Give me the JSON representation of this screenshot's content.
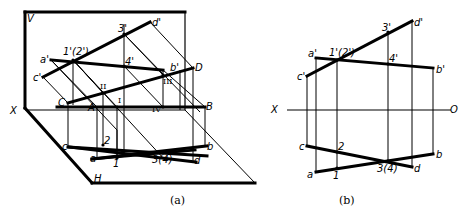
{
  "figure_a": {
    "caption": "(a)",
    "plane_labels": {
      "V": "V",
      "X": "X",
      "H": "H"
    },
    "points_vertical": {
      "a_prime": "a'",
      "c_prime": "c'",
      "p12_prime": "1'(2')",
      "p3_prime": "3'",
      "p4_prime": "4'",
      "d_prime": "d'",
      "b_prime": "b'"
    },
    "points_space": {
      "A": "A",
      "B": "B",
      "C": "C",
      "D": "D",
      "I": "I",
      "II": "II",
      "III": "III",
      "IV": "IV"
    },
    "points_horizontal": {
      "a": "a",
      "b": "b",
      "c": "c",
      "d": "d",
      "p1": "1",
      "p2": "2",
      "p34": "3(4)"
    }
  },
  "figure_b": {
    "caption": "(b)",
    "axis": {
      "left": "X",
      "right": "O"
    },
    "points_vertical": {
      "a_prime": "a'",
      "c_prime": "c'",
      "p12_prime": "1'(2')",
      "p3_prime": "3'",
      "p4_prime": "4'",
      "d_prime": "d'",
      "b_prime": "b'"
    },
    "points_horizontal": {
      "a": "a",
      "b": "b",
      "c": "c",
      "d": "d",
      "p1": "1",
      "p2": "2",
      "p34": "3(4)"
    }
  }
}
